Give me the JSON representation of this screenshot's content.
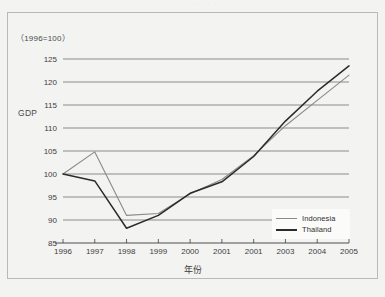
{
  "figure": {
    "base_note": "（1996=100）",
    "scan_noise": "· · ·   · · · ·  · ·   · ·",
    "y_axis_title": "GDP",
    "x_axis_title": "年份"
  },
  "legend": {
    "position": "inside-bottom-right",
    "items": [
      {
        "label": "Indonesia",
        "color": "#8a8a8a"
      },
      {
        "label": "Thailand",
        "color": "#2b2b2b"
      }
    ]
  },
  "chart_data": {
    "type": "line",
    "title": "",
    "subtitle": "（1996=100）",
    "xlabel": "年份",
    "ylabel": "GDP",
    "grid": true,
    "legend_position": "inside-bottom-right",
    "categories": [
      "1996",
      "1997",
      "1998",
      "1999",
      "2000",
      "2001",
      "2001",
      "2003",
      "2004",
      "2005"
    ],
    "x_tick_labels": [
      "1996",
      "1997",
      "1998",
      "1999",
      "2000",
      "2001",
      "2001",
      "2003",
      "2004",
      "2005"
    ],
    "y_tick_labels": [
      "85",
      "90",
      "95",
      "100",
      "105",
      "110",
      "115",
      "120",
      "125"
    ],
    "ylim": [
      85,
      125
    ],
    "ytick_step": 5,
    "series": [
      {
        "name": "Indonesia",
        "color": "#8a8a8a",
        "values": [
          100.0,
          104.8,
          91.0,
          91.4,
          95.7,
          98.8,
          104.0,
          110.5,
          116.0,
          121.5
        ]
      },
      {
        "name": "Thailand",
        "color": "#2b2b2b",
        "values": [
          100.0,
          98.5,
          88.2,
          91.0,
          95.8,
          98.3,
          103.8,
          111.5,
          118.0,
          123.5
        ]
      }
    ]
  }
}
